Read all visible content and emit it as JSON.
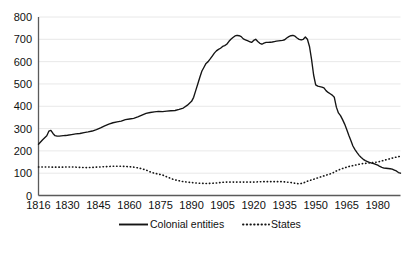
{
  "chart_data": {
    "type": "line",
    "title": "",
    "subtitle": "",
    "xlabel": "",
    "ylabel": "",
    "xlim": [
      1816,
      1991
    ],
    "ylim": [
      0,
      800
    ],
    "grid": true,
    "legend_position": "bottom",
    "y_ticks": [
      "0",
      "100",
      "200",
      "300",
      "400",
      "500",
      "600",
      "700",
      "800"
    ],
    "y_tick_values": [
      0,
      100,
      200,
      300,
      400,
      500,
      600,
      700,
      800
    ],
    "x_ticks": [
      "1816",
      "1830",
      "1845",
      "1860",
      "1875",
      "1890",
      "1905",
      "1920",
      "1935",
      "1950",
      "1965",
      "1980"
    ],
    "x_tick_values": [
      1816,
      1830,
      1845,
      1860,
      1875,
      1890,
      1905,
      1920,
      1935,
      1950,
      1965,
      1980
    ],
    "series": [
      {
        "name": "Colonial entities",
        "style": "solid",
        "color": "#141414",
        "x": [
          1816,
          1818,
          1820,
          1821,
          1822,
          1823,
          1824,
          1825,
          1826,
          1827,
          1828,
          1829,
          1830,
          1832,
          1834,
          1836,
          1838,
          1840,
          1842,
          1844,
          1846,
          1848,
          1850,
          1852,
          1854,
          1856,
          1858,
          1860,
          1862,
          1864,
          1866,
          1868,
          1870,
          1872,
          1874,
          1876,
          1878,
          1880,
          1882,
          1884,
          1886,
          1888,
          1890,
          1891,
          1892,
          1893,
          1894,
          1895,
          1896,
          1897,
          1898,
          1899,
          1900,
          1901,
          1902,
          1903,
          1904,
          1905,
          1906,
          1907,
          1908,
          1909,
          1910,
          1911,
          1912,
          1913,
          1914,
          1915,
          1916,
          1917,
          1918,
          1919,
          1920,
          1921,
          1922,
          1923,
          1924,
          1925,
          1926,
          1927,
          1928,
          1929,
          1930,
          1931,
          1932,
          1933,
          1934,
          1935,
          1936,
          1937,
          1938,
          1939,
          1940,
          1941,
          1942,
          1943,
          1944,
          1945,
          1946,
          1947,
          1948,
          1949,
          1950,
          1951,
          1952,
          1953,
          1954,
          1955,
          1956,
          1957,
          1958,
          1959,
          1960,
          1961,
          1962,
          1963,
          1964,
          1965,
          1966,
          1967,
          1968,
          1969,
          1970,
          1971,
          1972,
          1973,
          1974,
          1975,
          1976,
          1977,
          1978,
          1979,
          1980,
          1981,
          1982,
          1983,
          1984,
          1985,
          1986,
          1987,
          1988,
          1989,
          1990,
          1991
        ],
        "y": [
          230,
          250,
          268,
          288,
          292,
          278,
          268,
          266,
          266,
          267,
          268,
          269,
          270,
          273,
          276,
          278,
          282,
          285,
          289,
          295,
          303,
          312,
          320,
          326,
          330,
          333,
          340,
          343,
          346,
          352,
          360,
          368,
          372,
          375,
          377,
          376,
          378,
          380,
          381,
          386,
          392,
          405,
          422,
          440,
          470,
          500,
          530,
          558,
          575,
          592,
          600,
          612,
          625,
          638,
          648,
          655,
          660,
          668,
          672,
          678,
          690,
          700,
          708,
          715,
          718,
          716,
          712,
          702,
          698,
          694,
          690,
          686,
          695,
          700,
          690,
          682,
          678,
          683,
          686,
          686,
          687,
          688,
          690,
          692,
          693,
          694,
          695,
          698,
          706,
          712,
          716,
          718,
          714,
          706,
          700,
          697,
          700,
          710,
          700,
          668,
          610,
          540,
          496,
          490,
          488,
          486,
          482,
          470,
          462,
          456,
          450,
          440,
          396,
          370,
          358,
          340,
          320,
          296,
          270,
          246,
          222,
          206,
          192,
          180,
          170,
          162,
          156,
          152,
          148,
          145,
          143,
          140,
          136,
          130,
          126,
          123,
          122,
          121,
          120,
          118,
          114,
          110,
          103,
          100
        ]
      },
      {
        "name": "States",
        "style": "dotted",
        "color": "#141414",
        "x": [
          1816,
          1818,
          1820,
          1822,
          1824,
          1826,
          1828,
          1830,
          1832,
          1834,
          1836,
          1838,
          1840,
          1842,
          1844,
          1846,
          1848,
          1850,
          1852,
          1854,
          1856,
          1858,
          1860,
          1862,
          1864,
          1866,
          1868,
          1870,
          1872,
          1874,
          1876,
          1878,
          1880,
          1882,
          1884,
          1886,
          1888,
          1890,
          1892,
          1894,
          1896,
          1898,
          1900,
          1902,
          1904,
          1906,
          1908,
          1910,
          1912,
          1914,
          1916,
          1918,
          1920,
          1922,
          1924,
          1926,
          1928,
          1930,
          1932,
          1934,
          1936,
          1938,
          1940,
          1942,
          1944,
          1946,
          1948,
          1950,
          1952,
          1954,
          1956,
          1958,
          1960,
          1962,
          1964,
          1966,
          1968,
          1970,
          1972,
          1974,
          1976,
          1978,
          1980,
          1982,
          1984,
          1986,
          1988,
          1990,
          1991
        ],
        "y": [
          128,
          128,
          128,
          127,
          127,
          127,
          127,
          128,
          128,
          127,
          126,
          125,
          125,
          126,
          127,
          128,
          129,
          130,
          131,
          131,
          131,
          130,
          129,
          127,
          124,
          120,
          114,
          106,
          100,
          96,
          92,
          84,
          76,
          70,
          66,
          62,
          60,
          58,
          56,
          55,
          54,
          54,
          55,
          56,
          58,
          60,
          60,
          60,
          60,
          60,
          60,
          60,
          60,
          61,
          62,
          62,
          62,
          62,
          62,
          62,
          60,
          58,
          55,
          52,
          56,
          64,
          70,
          76,
          82,
          88,
          94,
          100,
          110,
          118,
          124,
          130,
          134,
          138,
          142,
          144,
          146,
          148,
          150,
          155,
          160,
          165,
          170,
          174,
          176
        ]
      }
    ],
    "legend": [
      {
        "label": "Colonial entities",
        "style": "solid"
      },
      {
        "label": "States",
        "style": "dotted"
      }
    ]
  }
}
